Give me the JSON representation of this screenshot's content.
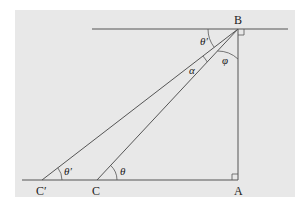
{
  "diagram": {
    "background_color": "#e6e6e6",
    "line_color": "#555555",
    "points": {
      "A": {
        "label": "A",
        "x": 238,
        "y": 180
      },
      "B": {
        "label": "B",
        "x": 238,
        "y": 29
      },
      "C": {
        "label": "C",
        "x": 97,
        "y": 180
      },
      "C_prime": {
        "label": "C′",
        "x": 42,
        "y": 180
      }
    },
    "angles": {
      "theta": "θ",
      "theta_prime_bottom": "θ′",
      "theta_prime_top": "θ′",
      "alpha": "α",
      "phi": "φ"
    }
  }
}
